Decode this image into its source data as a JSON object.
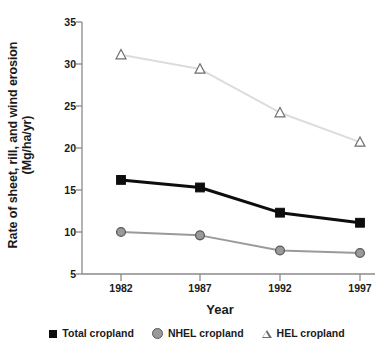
{
  "chart_data": {
    "type": "line",
    "title": "",
    "xlabel": "Year",
    "ylabel": "Rate of sheet, rill, and wind erosion (Mg/ha/yr)",
    "ylabel_line1": "Rate of sheet, rill, and wind erosion",
    "ylabel_line2": "(Mg/ha/yr)",
    "categories": [
      "1982",
      "1987",
      "1992",
      "1997"
    ],
    "x": [
      1982,
      1987,
      1992,
      1997
    ],
    "xlim": [
      1980.3,
      1998.7
    ],
    "ylim": [
      5,
      35
    ],
    "yticks": [
      5,
      10,
      15,
      20,
      25,
      30,
      35
    ],
    "xticks": [
      "1982",
      "1987",
      "1992",
      "1997"
    ],
    "grid": false,
    "legend_position": "bottom",
    "series": [
      {
        "name": "Total cropland",
        "marker": "square",
        "color": "#0d0d0d",
        "values": [
          16.2,
          15.3,
          12.3,
          11.1
        ]
      },
      {
        "name": "NHEL cropland",
        "marker": "circle",
        "color": "#9a9a9a",
        "values": [
          10.0,
          9.6,
          7.8,
          7.5
        ]
      },
      {
        "name": "HEL cropland",
        "marker": "triangle-open",
        "color": "#dcdcdc",
        "values": [
          31.1,
          29.4,
          24.2,
          20.7
        ]
      }
    ]
  },
  "axis": {
    "y_label_line1": "Rate of sheet, rill, and wind erosion",
    "y_label_line2": "(Mg/ha/yr)",
    "x_label": "Year",
    "y_ticks": [
      "35",
      "30",
      "25",
      "20",
      "15",
      "10",
      "5"
    ],
    "x_ticks": [
      "1982",
      "1987",
      "1992",
      "1997"
    ]
  },
  "legend": {
    "items": [
      {
        "label": "Total cropland",
        "marker": "filled-square-marker"
      },
      {
        "label": "NHEL cropland",
        "marker": "filled-circle-marker"
      },
      {
        "label": "HEL cropland",
        "marker": "open-triangle-marker"
      }
    ]
  },
  "colors": {
    "axis": "#8a8a8a",
    "text": "#1a1a1a",
    "total_cropland": "#0d0d0d",
    "nhel_cropland": "#9a9a9a",
    "hel_cropland": "#dcdcdc",
    "background": "#ffffff"
  }
}
